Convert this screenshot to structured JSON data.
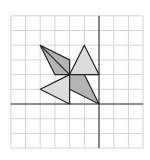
{
  "figure": {
    "grid": {
      "x_min": -6,
      "x_max": 3,
      "y_min": -3,
      "y_max": 6,
      "origin_px": [
        99,
        104
      ],
      "unit_px": 14.7,
      "grid_color": "#d4d4d4",
      "axis_color": "#6e6e6e"
    },
    "shapes": [
      {
        "name": "dark-quad-upper-left",
        "points": [
          [
            -4,
            4
          ],
          [
            -2,
            3
          ],
          [
            -2,
            2
          ],
          [
            -3,
            2
          ]
        ],
        "fill": "#b4b4b4",
        "inner_line": [
          [
            -4,
            4
          ],
          [
            -2,
            2
          ]
        ]
      },
      {
        "name": "light-triangle-top",
        "points": [
          [
            -1,
            4
          ],
          [
            -2,
            2
          ],
          [
            0,
            2
          ]
        ],
        "fill": "#dcdcdc"
      },
      {
        "name": "light-triangle-left",
        "points": [
          [
            -4,
            1
          ],
          [
            -2,
            2
          ],
          [
            -2,
            0
          ]
        ],
        "fill": "#dcdcdc"
      },
      {
        "name": "dark-quad-lower-right",
        "points": [
          [
            -2,
            2
          ],
          [
            -1,
            2
          ],
          [
            0,
            0
          ],
          [
            -2,
            1
          ]
        ],
        "fill": "#b4b4b4"
      }
    ],
    "stroke_color": "#222222"
  }
}
